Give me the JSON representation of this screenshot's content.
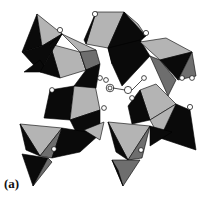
{
  "figure": {
    "panel_label": "(a)",
    "colors": {
      "dark_face": "#0a0a0a",
      "light_face": "#b4b4b4",
      "mid_face": "#6e6e6e",
      "atom_fill": "#ffffff",
      "background": "#ffffff"
    }
  }
}
